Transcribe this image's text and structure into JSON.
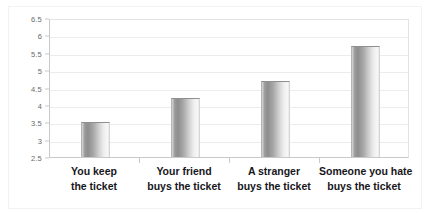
{
  "chart_data": {
    "type": "bar",
    "title": "",
    "xlabel": "",
    "ylabel": "",
    "categories": [
      "You keep\nthe ticket",
      "Your friend\nbuys the ticket",
      "A stranger\nbuys the ticket",
      "Someone you hate\nbuys the ticket"
    ],
    "category_lines": [
      [
        "You keep",
        "the ticket"
      ],
      [
        "Your friend",
        "buys the ticket"
      ],
      [
        "A stranger",
        "buys the ticket"
      ],
      [
        "Someone you hate",
        "buys the ticket"
      ]
    ],
    "values": [
      3.5,
      4.2,
      4.7,
      5.7
    ],
    "ylim": [
      2.5,
      6.5
    ],
    "ytick_step": 0.5,
    "yticks": [
      "6.5",
      "6",
      "5.5",
      "5",
      "4.5",
      "4",
      "3.5",
      "3",
      "2.5"
    ],
    "ytick_values": [
      6.5,
      6,
      5.5,
      5,
      4.5,
      4,
      3.5,
      3,
      2.5
    ],
    "grid": true,
    "legend": false,
    "bar_color": "#9a9a9a",
    "bar_gradient_light": "#f7f7f7",
    "gridline_color": "#ececec",
    "axis_color": "#c9c9c9",
    "label_color": "#17171b",
    "tick_label_color": "#6b6b6b",
    "background_color": "#ffffff"
  }
}
